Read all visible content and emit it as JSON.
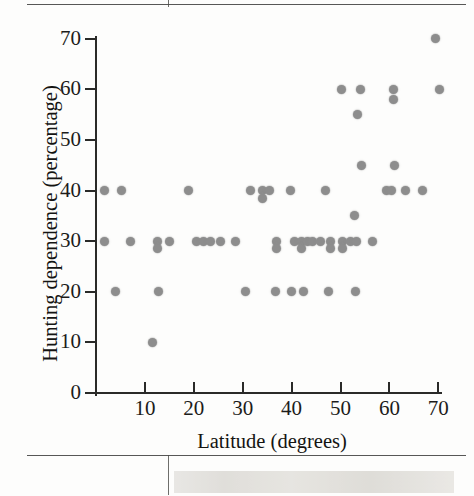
{
  "figure": {
    "kind": "scatter-plot",
    "background_color": "#fdfdfc",
    "dot_color": "#8d8d8d",
    "axis_color": "#2a2a28"
  },
  "chart_data": {
    "type": "scatter",
    "title": "",
    "xlabel": "Latitude (degrees)",
    "ylabel": "Hunting dependence (percentage)",
    "xlim": [
      0,
      72
    ],
    "ylim": [
      0,
      72
    ],
    "xticks": [
      10,
      20,
      30,
      40,
      50,
      60,
      70
    ],
    "xtick_labels": [
      "10",
      "20",
      "30",
      "40",
      "50",
      "60",
      "70"
    ],
    "yticks": [
      0,
      10,
      20,
      30,
      40,
      50,
      60,
      70
    ],
    "ytick_labels": [
      "0",
      "10",
      "20",
      "30",
      "40",
      "50",
      "60",
      "70"
    ],
    "grid": false,
    "legend": false,
    "marker": "circle",
    "points": [
      [
        1.8,
        40
      ],
      [
        5.3,
        40
      ],
      [
        1.8,
        30
      ],
      [
        7.0,
        30
      ],
      [
        4.0,
        20
      ],
      [
        11.6,
        10
      ],
      [
        12.7,
        20
      ],
      [
        12.6,
        30
      ],
      [
        12.6,
        28.5
      ],
      [
        15.0,
        30
      ],
      [
        19.0,
        40
      ],
      [
        20.5,
        30
      ],
      [
        22.0,
        30
      ],
      [
        23.5,
        30
      ],
      [
        25.5,
        30
      ],
      [
        28.5,
        30
      ],
      [
        30.5,
        20
      ],
      [
        31.5,
        40
      ],
      [
        34.0,
        40
      ],
      [
        34.0,
        38.5
      ],
      [
        35.5,
        40
      ],
      [
        36.8,
        20
      ],
      [
        37.0,
        30
      ],
      [
        37.0,
        28.5
      ],
      [
        39.8,
        40
      ],
      [
        40.0,
        20
      ],
      [
        40.5,
        30
      ],
      [
        42.0,
        30
      ],
      [
        42.0,
        28.5
      ],
      [
        42.5,
        20
      ],
      [
        43.3,
        30
      ],
      [
        44.2,
        30
      ],
      [
        46.0,
        30
      ],
      [
        47.0,
        40
      ],
      [
        47.5,
        20
      ],
      [
        48.0,
        30
      ],
      [
        48.0,
        28.5
      ],
      [
        50.2,
        60
      ],
      [
        50.5,
        30
      ],
      [
        50.5,
        28.5
      ],
      [
        52.0,
        30
      ],
      [
        52.8,
        35
      ],
      [
        53.0,
        20
      ],
      [
        53.2,
        30
      ],
      [
        53.5,
        55
      ],
      [
        54.0,
        60
      ],
      [
        54.2,
        45
      ],
      [
        56.5,
        30
      ],
      [
        59.5,
        40
      ],
      [
        60.5,
        40
      ],
      [
        60.8,
        60
      ],
      [
        60.8,
        58
      ],
      [
        61.0,
        45
      ],
      [
        63.3,
        40
      ],
      [
        66.8,
        40
      ],
      [
        69.5,
        70
      ],
      [
        70.2,
        60
      ]
    ]
  }
}
